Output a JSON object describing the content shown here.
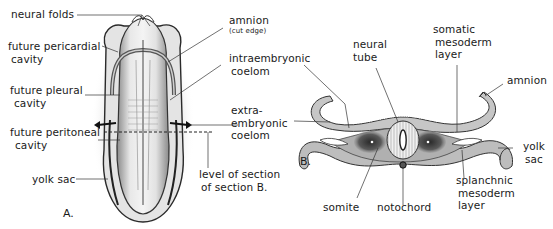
{
  "figure": {
    "panel_a": {
      "letter": "A.",
      "labels": {
        "neural_folds": "neural folds",
        "future_pericardial_1": "future pericardial",
        "future_pericardial_2": "cavity",
        "future_pleural_1": "future pleural",
        "future_pleural_2": "cavity",
        "future_peritoneal_1": "future peritoneal",
        "future_peritoneal_2": "cavity",
        "yolk_sac": "yolk sac",
        "amnion": "amnion",
        "amnion_note": "(cut edge)",
        "intraembryonic_1": "intraembryonic",
        "intraembryonic_2": "coelom",
        "extraembryonic_1": "extra-",
        "extraembryonic_2": "embryonic",
        "extraembryonic_3": "coelom",
        "level_1": "level of section",
        "level_2": "of section B."
      }
    },
    "panel_b": {
      "letter": "B.",
      "labels": {
        "neural_tube_1": "neural",
        "neural_tube_2": "tube",
        "somatic_1": "somatic",
        "somatic_2": "mesoderm",
        "somatic_3": "layer",
        "amnion": "amnion",
        "yolk_sac_1": "yolk",
        "yolk_sac_2": "sac",
        "splanchnic_1": "splanchnic",
        "splanchnic_2": "mesoderm",
        "splanchnic_3": "layer",
        "somite": "somite",
        "notochord": "notochord"
      }
    },
    "colors": {
      "ink": "#1a1a1a",
      "tissue": "#b8b8b8",
      "tissue_dark": "#4a4a4a",
      "neural_tube_fill": "#e6e6e6",
      "paper": "#ffffff"
    }
  }
}
